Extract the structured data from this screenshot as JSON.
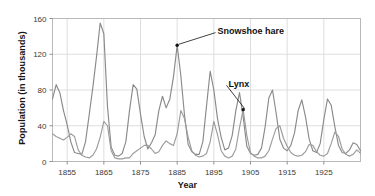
{
  "chart_data": {
    "type": "line",
    "title": "",
    "subtitle": "",
    "xlabel": "Year",
    "ylabel": "Population (in thousands)",
    "xlim": [
      1851,
      1935
    ],
    "ylim": [
      0,
      160
    ],
    "xticks": [
      1855,
      1865,
      1875,
      1885,
      1895,
      1905,
      1915,
      1925
    ],
    "yticks": [
      0,
      40,
      80,
      120,
      160
    ],
    "xticklabels": [
      "1855",
      "1865",
      "1875",
      "1885",
      "1895",
      "1905",
      "1915",
      "1925"
    ],
    "yticklabels": [
      "0",
      "40",
      "80",
      "120",
      "160"
    ],
    "grid": true,
    "grid_axis": "both",
    "legend": "none",
    "annotations": [
      {
        "label": "Snowshoe hare",
        "series": "Snowshoe hare",
        "x": 1885,
        "y": 130,
        "text_x": 1896,
        "text_y": 147
      },
      {
        "label": "Lynx",
        "series": "Lynx",
        "x": 1903,
        "y": 58,
        "text_x": 1899,
        "text_y": 88
      }
    ],
    "x": [
      1851,
      1852,
      1853,
      1854,
      1855,
      1856,
      1857,
      1858,
      1859,
      1860,
      1861,
      1862,
      1863,
      1864,
      1865,
      1866,
      1867,
      1868,
      1869,
      1870,
      1871,
      1872,
      1873,
      1874,
      1875,
      1876,
      1877,
      1878,
      1879,
      1880,
      1881,
      1882,
      1883,
      1884,
      1885,
      1886,
      1887,
      1888,
      1889,
      1890,
      1891,
      1892,
      1893,
      1894,
      1895,
      1896,
      1897,
      1898,
      1899,
      1900,
      1901,
      1902,
      1903,
      1904,
      1905,
      1906,
      1907,
      1908,
      1909,
      1910,
      1911,
      1912,
      1913,
      1914,
      1915,
      1916,
      1917,
      1918,
      1919,
      1920,
      1921,
      1922,
      1923,
      1924,
      1925,
      1926,
      1927,
      1928,
      1929,
      1930,
      1931,
      1932,
      1933,
      1934,
      1935
    ],
    "series": [
      {
        "name": "Snowshoe hare",
        "color": "#8a8a8a",
        "values": [
          70,
          86,
          77,
          57,
          41,
          22,
          10,
          9,
          8,
          22,
          52,
          83,
          117,
          155,
          143,
          61,
          16,
          7,
          6,
          9,
          22,
          57,
          86,
          81,
          53,
          28,
          14,
          21,
          30,
          57,
          73,
          60,
          70,
          95,
          130,
          96,
          52,
          19,
          11,
          8,
          8,
          22,
          62,
          101,
          80,
          48,
          27,
          13,
          15,
          29,
          57,
          77,
          50,
          17,
          9,
          7,
          8,
          15,
          39,
          71,
          80,
          54,
          25,
          15,
          12,
          18,
          32,
          57,
          69,
          50,
          25,
          12,
          10,
          20,
          47,
          70,
          63,
          39,
          18,
          10,
          9,
          13,
          21,
          19,
          12
        ]
      },
      {
        "name": "Lynx",
        "color": "#9c9c9c",
        "values": [
          31,
          28,
          26,
          24,
          27,
          31,
          28,
          13,
          7,
          5,
          4,
          7,
          14,
          27,
          45,
          40,
          12,
          4,
          3,
          3,
          4,
          4,
          9,
          12,
          15,
          18,
          18,
          14,
          9,
          11,
          18,
          23,
          20,
          18,
          31,
          57,
          48,
          27,
          12,
          7,
          5,
          6,
          9,
          22,
          45,
          30,
          12,
          6,
          4,
          6,
          14,
          38,
          58,
          29,
          10,
          6,
          4,
          4,
          6,
          12,
          25,
          37,
          40,
          26,
          17,
          10,
          7,
          6,
          7,
          11,
          19,
          18,
          11,
          7,
          6,
          9,
          20,
          33,
          28,
          14,
          8,
          6,
          8,
          13,
          9
        ]
      }
    ]
  }
}
